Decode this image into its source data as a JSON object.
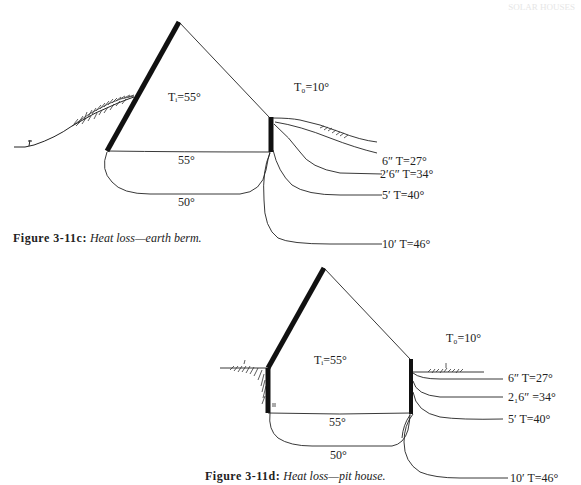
{
  "page": {
    "header_ghost_text": "SOLAR HOUSES"
  },
  "figures": [
    {
      "id": "3-11c",
      "caption_number": "Figure 3-11c:",
      "caption_text": "Heat loss—earth berm.",
      "labels": {
        "inside_temp": "Tᵢ=55°",
        "outside_temp": "T₀=10°",
        "floor_temp": "55°",
        "subfloor_temp": "50°"
      },
      "isotherms": [
        {
          "depth": "6″",
          "label": "6″ T=27°"
        },
        {
          "depth": "2′6″",
          "label": "2′6″ T=34°"
        },
        {
          "depth": "5′",
          "label": "5′ T=40°"
        },
        {
          "depth": "10′",
          "label": "10′ T=46°"
        }
      ]
    },
    {
      "id": "3-11d",
      "caption_number": "Figure 3-11d:",
      "caption_text": "Heat loss—pit house.",
      "labels": {
        "inside_temp": "Tᵢ=55°",
        "outside_temp": "T₀=10°",
        "floor_temp": "55°",
        "subfloor_temp": "50°"
      },
      "isotherms": [
        {
          "depth": "6″",
          "label": "6″ T=27°"
        },
        {
          "depth": "2₁6″",
          "label": "2₁6″ =34°"
        },
        {
          "depth": "5′",
          "label": "5′ T=40°"
        },
        {
          "depth": "10′",
          "label": "10′ T=46°"
        }
      ]
    }
  ],
  "colors": {
    "ink": "#1a1a1a",
    "paper": "#ffffff"
  }
}
